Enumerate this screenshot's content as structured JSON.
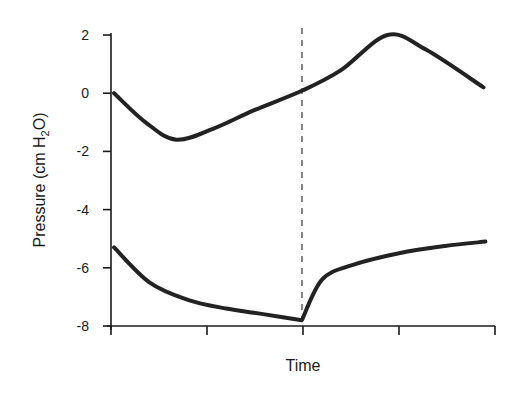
{
  "chart_data": {
    "type": "line",
    "title": "",
    "xlabel": "Time",
    "ylabel_parts": [
      "Pressure (cm H",
      "2",
      "O)"
    ],
    "ylabel": "Pressure (cm H2O)",
    "xlim": [
      0,
      1
    ],
    "ylim": [
      -8,
      2
    ],
    "x_ticks": [
      0,
      0.25,
      0.5,
      0.75,
      1
    ],
    "x_tick_labels": [
      "",
      "",
      "",
      "",
      ""
    ],
    "y_ticks": [
      2,
      0,
      -2,
      -4,
      -6,
      -8
    ],
    "y_tick_labels": [
      "2",
      "0",
      "-2",
      "-4",
      "-6",
      "-8"
    ],
    "grid": false,
    "legend": null,
    "vertical_marker": {
      "x": 0.5,
      "style": "dashed"
    },
    "series": [
      {
        "name": "upper",
        "x": [
          0.008,
          0.09,
          0.17,
          0.27,
          0.37,
          0.5,
          0.6,
          0.72,
          0.82,
          0.97
        ],
        "y": [
          0,
          -1.0,
          -1.6,
          -1.2,
          -0.6,
          0.1,
          0.8,
          2.0,
          1.5,
          0.2
        ]
      },
      {
        "name": "lower",
        "x": [
          0.008,
          0.1,
          0.2,
          0.3,
          0.4,
          0.497,
          0.55,
          0.63,
          0.75,
          0.87,
          0.975
        ],
        "y": [
          -5.3,
          -6.5,
          -7.1,
          -7.4,
          -7.6,
          -7.8,
          -6.4,
          -5.9,
          -5.5,
          -5.25,
          -5.1
        ]
      }
    ]
  }
}
